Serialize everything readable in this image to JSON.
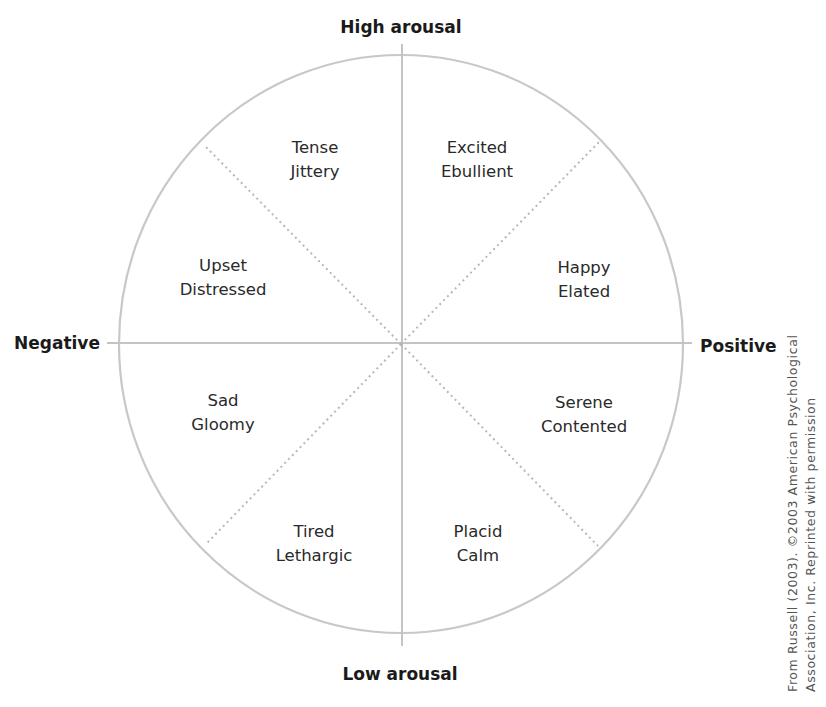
{
  "diagram": {
    "type": "circumplex",
    "axes": {
      "top": "High arousal",
      "bottom": "Low arousal",
      "left": "Negative",
      "right": "Positive"
    },
    "segments": [
      {
        "position": "upper-left-inner",
        "line1": "Tense",
        "line2": "Jittery"
      },
      {
        "position": "upper-right-inner",
        "line1": "Excited",
        "line2": "Ebullient"
      },
      {
        "position": "upper-left-outer",
        "line1": "Upset",
        "line2": "Distressed"
      },
      {
        "position": "upper-right-outer",
        "line1": "Happy",
        "line2": "Elated"
      },
      {
        "position": "lower-left-outer",
        "line1": "Sad",
        "line2": "Gloomy"
      },
      {
        "position": "lower-right-outer",
        "line1": "Serene",
        "line2": "Contented"
      },
      {
        "position": "lower-left-inner",
        "line1": "Tired",
        "line2": "Lethargic"
      },
      {
        "position": "lower-right-inner",
        "line1": "Placid",
        "line2": "Calm"
      }
    ],
    "credit": {
      "line1": "From Russell (2003). ©2003 American Psychological",
      "line2": "Association, Inc. Reprinted with permission"
    },
    "colors": {
      "circle": "#c8c8c8",
      "axis_lines": "#c4c4c4",
      "dotted_lines": "#b8b8b8",
      "label_text": "#1a1a1a"
    }
  }
}
